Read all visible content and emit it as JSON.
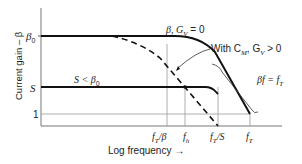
{
  "diagram": {
    "type": "frequency-response-sketch",
    "y_axis_label": "Current gain – β",
    "x_axis_label": "Log frequency →",
    "y_ticks": [
      {
        "label": "β₀",
        "level": "beta0"
      },
      {
        "label": "S",
        "level": "S"
      },
      {
        "label": "1",
        "level": "one"
      }
    ],
    "x_ticks": [
      {
        "label": "f_T/β",
        "main": "f",
        "sub": "T",
        "suffix": "/β"
      },
      {
        "label": "f_h",
        "main": "f",
        "sub": "h",
        "suffix": ""
      },
      {
        "label": "f_T/S",
        "main": "f",
        "sub": "T",
        "suffix": "/S"
      },
      {
        "label": "f_T",
        "main": "f",
        "sub": "T",
        "suffix": ""
      }
    ],
    "curves": [
      {
        "name": "beta-gv-zero",
        "label": "β, G_V = 0",
        "style": "solid"
      },
      {
        "name": "with-cm-gv",
        "label": "With C_M, G_V > 0",
        "style": "dashed"
      },
      {
        "name": "s-level",
        "label": "S < β₀",
        "style": "solid"
      }
    ],
    "annotations": {
      "beta_gv": {
        "pre": "β, G",
        "sub": "V",
        "post": " = 0"
      },
      "with_cm": {
        "pre": "With C",
        "sub1": "M",
        "mid": ", G",
        "sub2": "V",
        "post": " > 0"
      },
      "s_less": {
        "pre": "S < β",
        "sub": "0"
      },
      "slope": {
        "pre": "βf = f",
        "sub": "T"
      },
      "beta0": {
        "pre": "β",
        "sub": "0"
      },
      "s": "S",
      "one": "1"
    },
    "labels": {
      "ylabel": "Current gain – β",
      "xlabel": "Log frequency",
      "arrow": "→"
    }
  }
}
